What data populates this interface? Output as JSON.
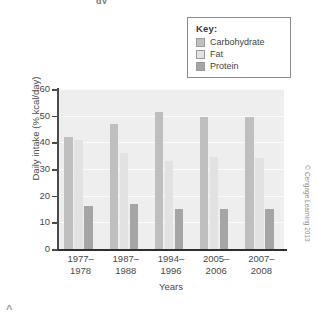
{
  "legend": {
    "title": "Key:",
    "entries": [
      {
        "label": "Carbohydrate",
        "color": "#bfbfbf"
      },
      {
        "label": "Fat",
        "color": "#e2e2e2"
      },
      {
        "label": "Protein",
        "color": "#a5a5a5"
      }
    ]
  },
  "credit": "© Cengage Learning 2013",
  "fragments": {
    "top": "gy",
    "bottom": "^"
  },
  "chart_data": {
    "type": "bar",
    "title": "",
    "xlabel": "Years",
    "ylabel": "Daily intake (% kcal/day)",
    "ylim": [
      0,
      60
    ],
    "yticks": [
      0,
      10,
      20,
      30,
      40,
      50,
      60
    ],
    "grid": true,
    "legend_position": "top-right",
    "categories": [
      "1977–\n1978",
      "1987–\n1988",
      "1994–\n1996",
      "2005–\n2006",
      "2007–\n2008"
    ],
    "category_lines": [
      [
        "1977–",
        "1978"
      ],
      [
        "1987–",
        "1988"
      ],
      [
        "1994–",
        "1996"
      ],
      [
        "2005–",
        "2006"
      ],
      [
        "2007–",
        "2008"
      ]
    ],
    "series": [
      {
        "name": "Carbohydrate",
        "color": "#bfbfbf",
        "values": [
          42.0,
          47.0,
          51.5,
          49.5,
          49.5
        ]
      },
      {
        "name": "Fat",
        "color": "#e2e2e2",
        "values": [
          41.0,
          36.0,
          33.0,
          34.5,
          34.0
        ]
      },
      {
        "name": "Protein",
        "color": "#a5a5a5",
        "values": [
          16.0,
          17.0,
          15.0,
          15.0,
          15.0
        ]
      }
    ]
  }
}
